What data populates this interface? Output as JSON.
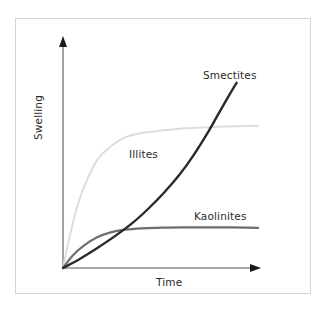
{
  "chart_data": {
    "type": "line",
    "title": "",
    "subtitle": "",
    "xlabel": "Time",
    "ylabel": "Swelling",
    "xlim": [
      0,
      1
    ],
    "ylim": [
      0,
      1
    ],
    "grid": false,
    "legend_position": "inline-annotations",
    "axis_style": "arrow-axes-no-ticks",
    "xticks": [],
    "yticks": [],
    "annotations": [
      {
        "text": "Smectites",
        "x": 0.72,
        "y": 0.85
      },
      {
        "text": "Illites",
        "x": 0.34,
        "y": 0.5
      },
      {
        "text": "Kaolinites",
        "x": 0.67,
        "y": 0.25
      }
    ],
    "series": [
      {
        "name": "Illites",
        "color": "#dddddd",
        "width": 2.0,
        "shape": "saturating-fast",
        "x": [
          0.0,
          0.04,
          0.08,
          0.13,
          0.18,
          0.24,
          0.31,
          0.39,
          0.48,
          0.58,
          0.69,
          0.8,
          0.91,
          1.0
        ],
        "y": [
          0.0,
          0.16,
          0.29,
          0.4,
          0.48,
          0.53,
          0.57,
          0.59,
          0.6,
          0.61,
          0.615,
          0.62,
          0.622,
          0.623
        ]
      },
      {
        "name": "Kaolinites",
        "color": "#6e6e6e",
        "width": 2.2,
        "shape": "saturating-low",
        "x": [
          0.0,
          0.05,
          0.11,
          0.17,
          0.24,
          0.32,
          0.41,
          0.51,
          0.62,
          0.73,
          0.84,
          0.94,
          1.0
        ],
        "y": [
          0.0,
          0.055,
          0.1,
          0.133,
          0.155,
          0.168,
          0.174,
          0.177,
          0.178,
          0.178,
          0.178,
          0.177,
          0.176
        ]
      },
      {
        "name": "Smectites",
        "color": "#2a2a2a",
        "width": 2.4,
        "shape": "exponential-accelerating",
        "x": [
          0.0,
          0.09,
          0.18,
          0.27,
          0.36,
          0.44,
          0.52,
          0.6,
          0.67,
          0.74,
          0.8,
          0.85,
          0.89
        ],
        "y": [
          0.0,
          0.042,
          0.09,
          0.142,
          0.2,
          0.262,
          0.332,
          0.412,
          0.495,
          0.59,
          0.68,
          0.755,
          0.812
        ]
      }
    ]
  },
  "icons": {
    "x_axis_arrow": "arrow-right-icon",
    "y_axis_arrow": "arrow-up-icon"
  }
}
